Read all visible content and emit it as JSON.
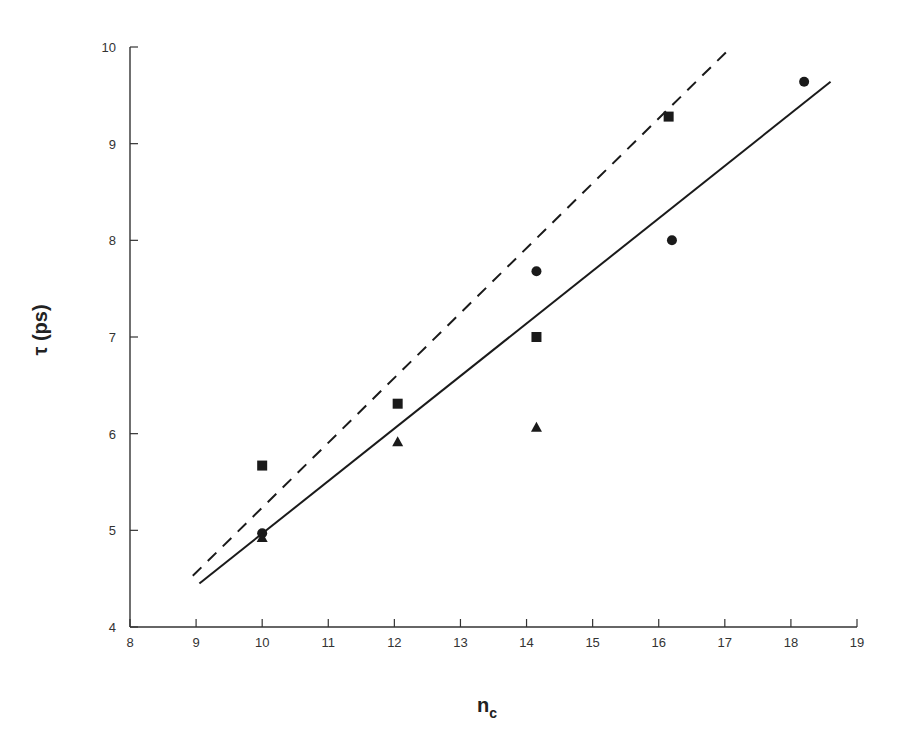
{
  "chart_data": {
    "type": "scatter",
    "title": "",
    "xlabel": "n_c",
    "xlabel_main": "n",
    "xlabel_sub": "c",
    "ylabel": "τ (ps)",
    "xlim": [
      8,
      19
    ],
    "ylim": [
      4,
      10
    ],
    "xticks": [
      8,
      9,
      10,
      11,
      12,
      13,
      14,
      15,
      16,
      17,
      18,
      19
    ],
    "yticks": [
      4,
      5,
      6,
      7,
      8,
      9,
      10
    ],
    "grid": false,
    "legend": null,
    "series": [
      {
        "name": "circles",
        "marker": "circle",
        "points": [
          {
            "x": 10.0,
            "y": 4.97
          },
          {
            "x": 14.15,
            "y": 7.68
          },
          {
            "x": 16.2,
            "y": 8.0
          },
          {
            "x": 18.2,
            "y": 9.64
          }
        ]
      },
      {
        "name": "squares",
        "marker": "square",
        "points": [
          {
            "x": 10.0,
            "y": 5.67
          },
          {
            "x": 12.05,
            "y": 6.31
          },
          {
            "x": 14.15,
            "y": 7.0
          },
          {
            "x": 16.15,
            "y": 9.28
          }
        ]
      },
      {
        "name": "triangles",
        "marker": "triangle",
        "points": [
          {
            "x": 10.0,
            "y": 4.92
          },
          {
            "x": 12.05,
            "y": 5.91
          },
          {
            "x": 14.15,
            "y": 6.06
          }
        ]
      }
    ],
    "lines": [
      {
        "name": "solid-fit",
        "style": "solid",
        "x": [
          9.05,
          18.6
        ],
        "y": [
          4.45,
          9.64
        ]
      },
      {
        "name": "dashed-fit",
        "style": "dashed",
        "x": [
          8.95,
          17.1
        ],
        "y": [
          4.53,
          10.0
        ]
      }
    ]
  },
  "colors": {
    "ink": "#1a1a1a",
    "axis": "#333333",
    "background": "#ffffff"
  }
}
